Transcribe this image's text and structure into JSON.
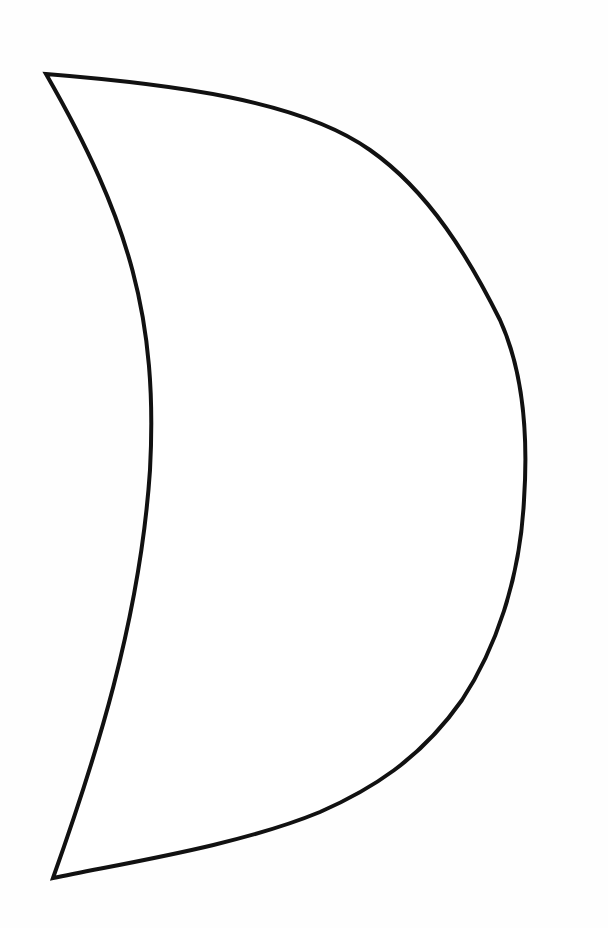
{
  "figure": {
    "shape": "crescent",
    "stroke_color": "#111111",
    "fill_color": "#ffffff",
    "background_color": "#fefefe",
    "stroke_width": 4
  }
}
